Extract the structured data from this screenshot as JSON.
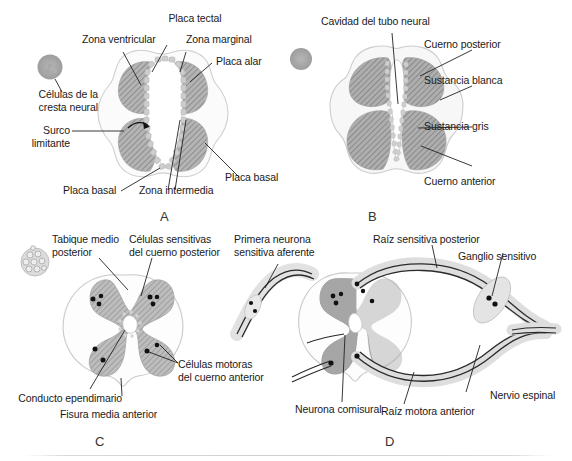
{
  "figure": {
    "background_color": "#ffffff",
    "text_color": "#1a1a1a",
    "gray_matter_color": "#a8a8a8",
    "white_matter_color": "#f2f2f2",
    "outline_color": "#c9c9c9",
    "hatch_color": "#8c8c8c",
    "neuron_dot_color": "#111111",
    "nerve_color": "#e2e2e2"
  },
  "panels": [
    {
      "id": "A",
      "letter": "A",
      "labels": [
        {
          "key": "placa_tectal",
          "text": "Placa tectal"
        },
        {
          "key": "zona_ventricular",
          "text": "Zona ventricular"
        },
        {
          "key": "zona_marginal",
          "text": "Zona marginal"
        },
        {
          "key": "placa_alar",
          "text": "Placa alar"
        },
        {
          "key": "celulas_cresta_neural",
          "text": "Células de la\ncresta neural"
        },
        {
          "key": "surco_limitante",
          "text": "Surco\nlimitante"
        },
        {
          "key": "placa_basal_inferior",
          "text": "Placa basal"
        },
        {
          "key": "zona_intermedia",
          "text": "Zona intermedia"
        },
        {
          "key": "placa_basal_derecha",
          "text": "Placa basal"
        }
      ]
    },
    {
      "id": "B",
      "letter": "B",
      "labels": [
        {
          "key": "cavidad_tubo_neural",
          "text": "Cavidad del tubo neural"
        },
        {
          "key": "cuerno_posterior",
          "text": "Cuerno posterior"
        },
        {
          "key": "sustancia_blanca",
          "text": "Sustancia blanca"
        },
        {
          "key": "sustancia_gris",
          "text": "Sustancia gris"
        },
        {
          "key": "cuerno_anterior",
          "text": "Cuerno anterior"
        }
      ]
    },
    {
      "id": "C",
      "letter": "C",
      "labels": [
        {
          "key": "tabique_medio_posterior",
          "text": "Tabique medio\nposterior"
        },
        {
          "key": "celulas_sensitivas",
          "text": "Células sensitivas\ndel cuerno posterior"
        },
        {
          "key": "celulas_motoras",
          "text": "Células motoras\ndel cuerno anterior"
        },
        {
          "key": "conducto_ependimario",
          "text": "Conducto ependimario"
        },
        {
          "key": "fisura_media_anterior",
          "text": "Fisura media anterior"
        }
      ]
    },
    {
      "id": "D",
      "letter": "D",
      "labels": [
        {
          "key": "primera_neurona",
          "text": "Primera neurona\nsensitiva aferente"
        },
        {
          "key": "raiz_sensitiva_posterior",
          "text": "Raíz sensitiva posterior"
        },
        {
          "key": "ganglio_sensitivo",
          "text": "Ganglio sensitivo"
        },
        {
          "key": "nervio_espinal",
          "text": "Nervio espinal"
        },
        {
          "key": "raiz_motora_anterior",
          "text": "Raíz motora anterior"
        },
        {
          "key": "neurona_comisural",
          "text": "Neurona comisural"
        }
      ]
    }
  ]
}
